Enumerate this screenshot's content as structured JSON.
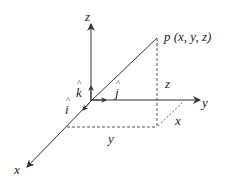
{
  "diagram": {
    "type": "3d-cartesian-coordinate-system",
    "colors": {
      "axis": "#333333",
      "dashed": "#444444",
      "text": "#222222"
    },
    "axes": {
      "z": {
        "label": "z"
      },
      "y": {
        "label": "y"
      },
      "x": {
        "label": "x"
      }
    },
    "point": {
      "label": "p (x, y, z)"
    },
    "unit_vectors": {
      "k": {
        "label": "k"
      },
      "j": {
        "label": "j"
      },
      "i": {
        "label": "i"
      }
    },
    "projection_labels": {
      "z": "z",
      "x": "x",
      "y": "y"
    }
  }
}
